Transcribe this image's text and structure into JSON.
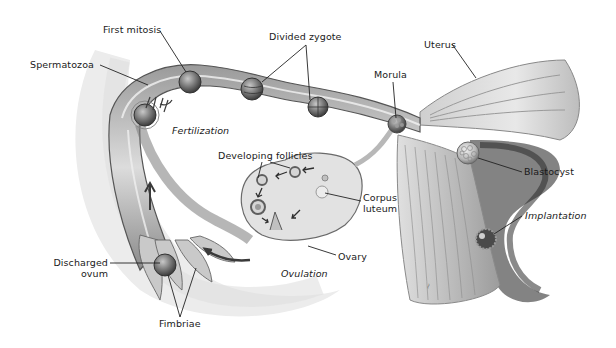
{
  "diagram": {
    "labels": {
      "first_mitosis": "First mitosis",
      "spermatozoa": "Spermatozoa",
      "divided_zygote": "Divided zygote",
      "uterus": "Uterus",
      "morula": "Morula",
      "fertilization": "Fertilization",
      "blastocyst": "Blastocyst",
      "developing_follicles": "Developing follicles",
      "corpus_luteum_line1": "Corpus",
      "corpus_luteum_line2": "luteum",
      "implantation": "Implantation",
      "ovary": "Ovary",
      "ovulation": "Ovulation",
      "discharged_ovum_line1": "Discharged",
      "discharged_ovum_line2": "ovum",
      "fimbriae": "Fimbriae"
    },
    "colors": {
      "background": "#ffffff",
      "tissue_light": "#d9d9d9",
      "tissue_mid": "#a8a8a8",
      "tissue_dark": "#5a5a5a",
      "leader_line": "#222222",
      "text": "#1a1a1a"
    }
  }
}
